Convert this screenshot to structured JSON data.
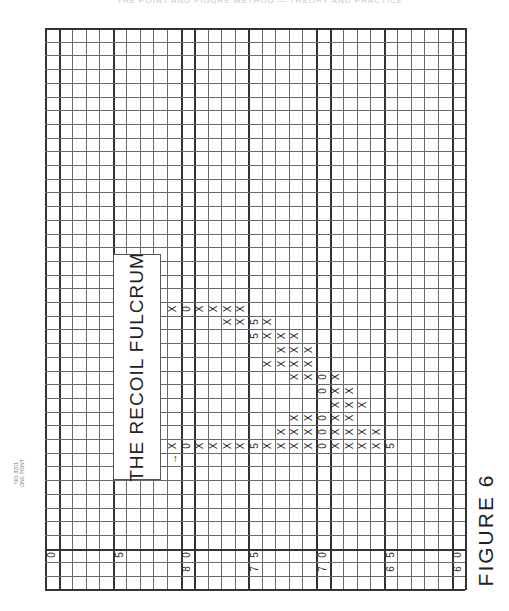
{
  "header": {
    "text": "THE POINT AND FIGURE METHOD — THEORY AND PRACTICE"
  },
  "paper_id": {
    "line1": "NO. 3201",
    "line2": "ONE POINT"
  },
  "title": "THE RECOIL FULCRUM",
  "figure_caption": "FIGURE 6",
  "axis_labels": [
    {
      "col": 0,
      "row": 38,
      "text": "0"
    },
    {
      "col": 5,
      "row": 38,
      "text": "5"
    },
    {
      "col": 10,
      "row": 38,
      "text": "0"
    },
    {
      "col": 10,
      "row": 39,
      "text": "8"
    },
    {
      "col": 15,
      "row": 38,
      "text": "5"
    },
    {
      "col": 15,
      "row": 39,
      "text": "7"
    },
    {
      "col": 20,
      "row": 38,
      "text": "0"
    },
    {
      "col": 20,
      "row": 39,
      "text": "7"
    },
    {
      "col": 25,
      "row": 38,
      "text": "5"
    },
    {
      "col": 25,
      "row": 39,
      "text": "6"
    },
    {
      "col": 30,
      "row": 38,
      "text": "0"
    },
    {
      "col": 30,
      "row": 39,
      "text": "6"
    }
  ],
  "chart_data": {
    "type": "table",
    "title": "THE RECOIL FULCRUM",
    "caption": "FIGURE 6",
    "price_scale_labels": [
      80,
      75,
      70,
      65,
      60
    ],
    "box_size": 1,
    "columns": [
      {
        "row": 20,
        "cells": [
          {
            "c": 9,
            "v": "X"
          },
          {
            "c": 10,
            "v": "0"
          },
          {
            "c": 11,
            "v": "X"
          },
          {
            "c": 12,
            "v": "X"
          },
          {
            "c": 13,
            "v": "X"
          },
          {
            "c": 14,
            "v": "X"
          }
        ]
      },
      {
        "row": 21,
        "cells": [
          {
            "c": 13,
            "v": "X"
          },
          {
            "c": 14,
            "v": "X"
          },
          {
            "c": 15,
            "v": "5"
          },
          {
            "c": 16,
            "v": "X"
          }
        ]
      },
      {
        "row": 22,
        "cells": [
          {
            "c": 15,
            "v": "5"
          },
          {
            "c": 16,
            "v": "X"
          },
          {
            "c": 17,
            "v": "X"
          },
          {
            "c": 18,
            "v": "X"
          }
        ]
      },
      {
        "row": 23,
        "cells": [
          {
            "c": 17,
            "v": "X"
          },
          {
            "c": 18,
            "v": "X"
          },
          {
            "c": 19,
            "v": "X"
          }
        ]
      },
      {
        "row": 24,
        "cells": [
          {
            "c": 16,
            "v": "X"
          },
          {
            "c": 17,
            "v": "X"
          },
          {
            "c": 18,
            "v": "X"
          },
          {
            "c": 19,
            "v": "X"
          }
        ]
      },
      {
        "row": 25,
        "cells": [
          {
            "c": 18,
            "v": "X"
          },
          {
            "c": 19,
            "v": "X"
          },
          {
            "c": 20,
            "v": "0"
          },
          {
            "c": 21,
            "v": "X"
          }
        ]
      },
      {
        "row": 26,
        "cells": [
          {
            "c": 20,
            "v": "0"
          },
          {
            "c": 21,
            "v": "X"
          },
          {
            "c": 22,
            "v": "X"
          }
        ]
      },
      {
        "row": 27,
        "cells": [
          {
            "c": 21,
            "v": "X"
          },
          {
            "c": 22,
            "v": "X"
          },
          {
            "c": 23,
            "v": "X"
          }
        ]
      },
      {
        "row": 28,
        "cells": [
          {
            "c": 18,
            "v": "X"
          },
          {
            "c": 19,
            "v": "X"
          },
          {
            "c": 20,
            "v": "0"
          },
          {
            "c": 21,
            "v": "X"
          },
          {
            "c": 22,
            "v": "X"
          }
        ]
      },
      {
        "row": 29,
        "cells": [
          {
            "c": 17,
            "v": "X"
          },
          {
            "c": 18,
            "v": "X"
          },
          {
            "c": 19,
            "v": "X"
          },
          {
            "c": 20,
            "v": "0"
          },
          {
            "c": 21,
            "v": "X"
          },
          {
            "c": 22,
            "v": "X"
          },
          {
            "c": 23,
            "v": "X"
          },
          {
            "c": 24,
            "v": "X"
          }
        ]
      },
      {
        "row": 30,
        "cells": [
          {
            "c": 9,
            "v": "X"
          },
          {
            "c": 10,
            "v": "0"
          },
          {
            "c": 11,
            "v": "X"
          },
          {
            "c": 12,
            "v": "X"
          },
          {
            "c": 13,
            "v": "X"
          },
          {
            "c": 14,
            "v": "X"
          },
          {
            "c": 15,
            "v": "5"
          },
          {
            "c": 16,
            "v": "X"
          },
          {
            "c": 17,
            "v": "X"
          },
          {
            "c": 18,
            "v": "X"
          },
          {
            "c": 19,
            "v": "X"
          },
          {
            "c": 20,
            "v": "0"
          },
          {
            "c": 21,
            "v": "X"
          },
          {
            "c": 22,
            "v": "X"
          },
          {
            "c": 23,
            "v": "X"
          },
          {
            "c": 24,
            "v": "X"
          },
          {
            "c": 25,
            "v": "5"
          }
        ]
      }
    ],
    "annotations": [
      {
        "row": 31,
        "col": 9,
        "text": "→"
      }
    ],
    "grid": {
      "cols": 31,
      "rows": 41,
      "cell_px": 13.55
    }
  }
}
